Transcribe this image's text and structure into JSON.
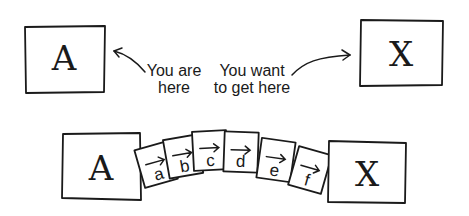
{
  "top_row": {
    "start_box": {
      "label": "A"
    },
    "end_box": {
      "label": "X"
    },
    "start_caption": {
      "line1": "You are",
      "line2": "here"
    },
    "end_caption": {
      "line1": "You want",
      "line2": "to get here"
    }
  },
  "bottom_row": {
    "start_box": {
      "label": "A"
    },
    "end_box": {
      "label": "X"
    },
    "steps": [
      {
        "label": "a"
      },
      {
        "label": "b"
      },
      {
        "label": "c"
      },
      {
        "label": "d"
      },
      {
        "label": "e"
      },
      {
        "label": "f"
      }
    ]
  }
}
